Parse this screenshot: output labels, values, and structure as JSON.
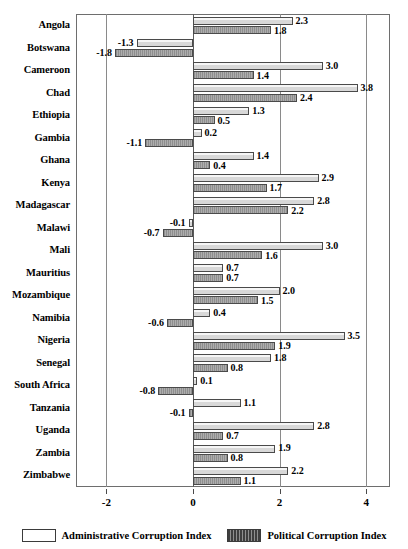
{
  "chart_data": {
    "type": "bar",
    "orientation": "horizontal",
    "title": "",
    "xlabel": "",
    "ylabel": "",
    "xlim": [
      -2.7,
      4.55
    ],
    "xticks": [
      -2,
      0,
      2,
      4
    ],
    "xtick_labels": [
      "-2",
      "0",
      "2",
      "4"
    ],
    "grid": true,
    "gridlines_x": [
      -2,
      0,
      2,
      4
    ],
    "legend_position": "bottom",
    "categories": [
      "Angola",
      "Botswana",
      "Cameroon",
      "Chad",
      "Ethiopia",
      "Gambia",
      "Ghana",
      "Kenya",
      "Madagascar",
      "Malawi",
      "Mali",
      "Mauritius",
      "Mozambique",
      "Namibia",
      "Nigeria",
      "Senegal",
      "South Africa",
      "Tanzania",
      "Uganda",
      "Zambia",
      "Zimbabwe"
    ],
    "series": [
      {
        "name": "Administrative Corruption Index",
        "key": "admin",
        "values": [
          2.3,
          -1.3,
          3.0,
          3.8,
          1.3,
          0.2,
          1.4,
          2.9,
          2.8,
          -0.1,
          3.0,
          0.7,
          2.0,
          0.4,
          3.5,
          1.8,
          0.1,
          1.1,
          2.8,
          1.9,
          2.2
        ],
        "labels": [
          "2.3",
          "-1.3",
          "3.0",
          "3.8",
          "1.3",
          "0.2",
          "1.4",
          "2.9",
          "2.8",
          "-0.1",
          "3.0",
          "0.7",
          "2.0",
          "0.4",
          "3.5",
          "1.8",
          "0.1",
          "1.1",
          "2.8",
          "1.9",
          "2.2"
        ]
      },
      {
        "name": "Political Corruption Index",
        "key": "political",
        "values": [
          1.8,
          -1.8,
          1.4,
          2.4,
          0.5,
          -1.1,
          0.4,
          1.7,
          2.2,
          -0.7,
          1.6,
          0.7,
          1.5,
          -0.6,
          1.9,
          0.8,
          -0.8,
          -0.1,
          0.7,
          0.8,
          1.1
        ],
        "labels": [
          "1.8",
          "-1.8",
          "1.4",
          "2.4",
          "0.5",
          "-1.1",
          "0.4",
          "1.7",
          "2.2",
          "-0.7",
          "1.6",
          "0.7",
          "1.5",
          "-0.6",
          "1.9",
          "0.8",
          "-0.8",
          "-0.1",
          "0.7",
          "0.8",
          "1.1"
        ]
      }
    ]
  },
  "legend": {
    "admin_label": "Administrative Corruption Index",
    "political_label": "Political Corruption Index"
  }
}
